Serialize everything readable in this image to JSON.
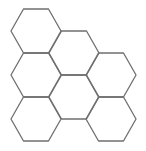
{
  "diagram": {
    "type": "hexagon-tiling",
    "hexagon_count": 7,
    "stroke_color": "#6f6f6f",
    "background": "#ffffff",
    "hexagons": [
      {
        "id": "hex-col0-row0",
        "cx": 36,
        "cy": 31
      },
      {
        "id": "hex-col0-row1",
        "cx": 36,
        "cy": 75
      },
      {
        "id": "hex-col0-row2",
        "cx": 36,
        "cy": 119
      },
      {
        "id": "hex-col1-row0",
        "cx": 74,
        "cy": 53
      },
      {
        "id": "hex-col1-row1",
        "cx": 74,
        "cy": 97
      },
      {
        "id": "hex-col2-row0",
        "cx": 111,
        "cy": 75
      },
      {
        "id": "hex-col2-row1",
        "cx": 111,
        "cy": 119
      }
    ]
  }
}
